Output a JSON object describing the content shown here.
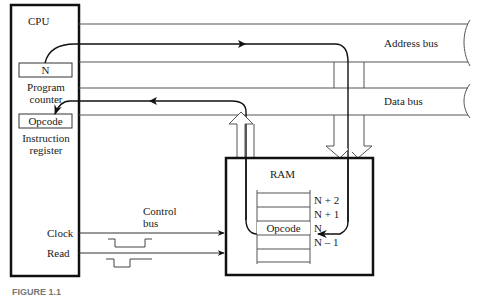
{
  "cpu": {
    "title": "CPU",
    "program_counter": {
      "value": "N",
      "label_line1": "Program",
      "label_line2": "counter"
    },
    "instruction_register": {
      "value": "Opcode",
      "label_line1": "Instruction",
      "label_line2": "register"
    },
    "signals": [
      "Clock",
      "Read"
    ]
  },
  "buses": {
    "address": "Address bus",
    "data": "Data bus",
    "control_line1": "Control",
    "control_line2": "bus"
  },
  "ram": {
    "title": "RAM",
    "cells": [
      {
        "address": "N + 2",
        "content": ""
      },
      {
        "address": "N + 1",
        "content": ""
      },
      {
        "address": "N",
        "content": "Opcode"
      },
      {
        "address": "N – 1",
        "content": ""
      }
    ]
  },
  "caption": "FIGURE 1.1"
}
